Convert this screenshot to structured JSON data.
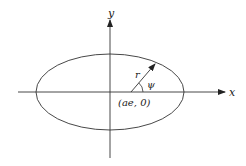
{
  "diagram": {
    "axes": {
      "x_label": "x",
      "y_label": "y"
    },
    "ellipse": {
      "center": [
        110,
        92
      ],
      "rx": 74,
      "ry": 38
    },
    "focus": {
      "label": "(ae, 0)",
      "position": [
        131,
        92
      ]
    },
    "radius_vector": {
      "label": "r",
      "from": [
        131,
        92
      ],
      "to": [
        155,
        64
      ]
    },
    "angle": {
      "label": "ψ"
    },
    "colors": {
      "line": "#333333",
      "background": "#ffffff"
    }
  }
}
